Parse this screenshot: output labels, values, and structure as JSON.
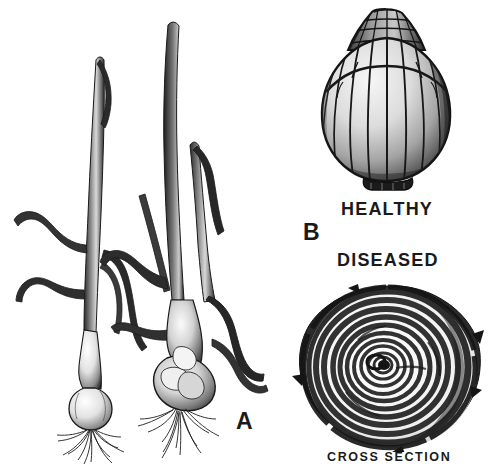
{
  "figure": {
    "kind": "botanical-illustration",
    "background_color": "#ffffff",
    "ink_color": "#1a1a1a",
    "width": 483,
    "height": 468
  },
  "labels": {
    "panel_a": "A",
    "panel_b": "B",
    "healthy": "HEALTHY",
    "diseased": "DISEASED",
    "cross_section": "CROSS SECTION"
  },
  "panels": [
    {
      "id": "A",
      "label": "A",
      "position": "left",
      "description": "Two onion plants drawn side by side with upright and drooping leaves, small bulbs and fibrous root masses",
      "items": [
        {
          "name": "left-plant",
          "state": "diseased",
          "leaves": 5,
          "bulb": "small, pale, narrow neck",
          "roots": "sparse fibrous root tuft"
        },
        {
          "name": "right-plant",
          "state": "diseased",
          "leaves": 6,
          "bulb": "swollen, lumpy, distorted",
          "roots": "sparse fibrous root tuft"
        }
      ]
    },
    {
      "id": "B",
      "label": "B",
      "position": "right",
      "description": "An intact whole onion bulb shown above a cut bulb cross section",
      "items": [
        {
          "name": "whole-bulb",
          "state": "HEALTHY",
          "caption": "HEALTHY",
          "description": "Globe-shaped bulb with vertical scale ridges and a ribbed dried neck"
        },
        {
          "name": "bulb-cross-section",
          "state": "DISEASED",
          "caption": "DISEASED",
          "sub_caption": "CROSS SECTION",
          "description": "Circular cut face showing concentric dark and light rings of bulb scales"
        }
      ]
    }
  ],
  "palette": {
    "ink": "#1a1a1a",
    "mid_gray": "#6e6e6e",
    "light_gray": "#c9c9c9",
    "highlight": "#f2f2f2",
    "paper": "#ffffff"
  }
}
